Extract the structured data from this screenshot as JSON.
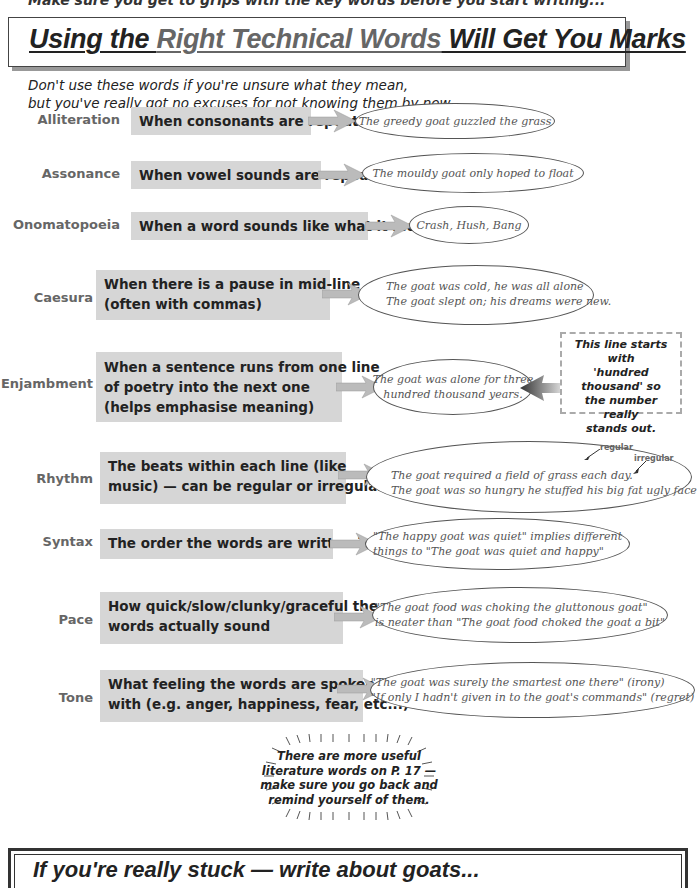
{
  "header": {
    "cut_off_line": "Make sure you get to grips with the key words before you start writing...",
    "title_part1": "Using the ",
    "title_part2": "Right Technical Words",
    "title_part3": " Will Get You Marks"
  },
  "intro": {
    "line1": "Don't use these words if you're unsure what they mean,",
    "line2": "but you've really got no excuses for not knowing them by now..."
  },
  "terms": [
    {
      "term": "Alliteration",
      "definition": [
        "When consonants are repeated"
      ],
      "example": [
        "The greedy goat guzzled the grass"
      ]
    },
    {
      "term": "Assonance",
      "definition": [
        "When vowel sounds are repeated"
      ],
      "example": [
        "The mouldy goat only hoped to float"
      ]
    },
    {
      "term": "Onomatopoeia",
      "definition": [
        "When a word sounds like what it means"
      ],
      "example": [
        "Crash, Hush, Bang"
      ]
    },
    {
      "term": "Caesura",
      "definition": [
        "When there is a pause in mid-line",
        "(often with commas)"
      ],
      "example": [
        "The goat was cold, he was all alone",
        "The goat slept on; his dreams were new."
      ]
    },
    {
      "term": "Enjambment",
      "definition": [
        "When a sentence runs from one line",
        "of poetry into the next one",
        "(helps emphasise meaning)"
      ],
      "example": [
        "The goat was alone for three",
        "hundred thousand years."
      ]
    },
    {
      "term": "Rhythm",
      "definition": [
        "The beats within each line (like",
        "music) — can be regular or irregular"
      ],
      "example": [
        "The goat required a field of grass each day.",
        "The goat was so hungry he stuffed his big fat ugly face"
      ]
    },
    {
      "term": "Syntax",
      "definition": [
        "The order the words are written in"
      ],
      "example": [
        "\"The happy goat was quiet\" implies different",
        "things to \"The goat was quiet and happy\""
      ]
    },
    {
      "term": "Pace",
      "definition": [
        "How quick/slow/clunky/graceful the",
        "words actually sound"
      ],
      "example": [
        "\"The goat food was choking the gluttonous goat\"",
        "is neater than \"The goat food choked the goat a bit\""
      ]
    },
    {
      "term": "Tone",
      "definition": [
        "What feeling the words are spoken",
        "with (e.g. anger, happiness, fear, etc...)"
      ],
      "example": [
        "\"The goat was surely the smartest one there\" (irony)",
        "\"If only I hadn't given in to the goat's commands\" (regret)"
      ]
    }
  ],
  "enjambment_note": [
    "This line starts with",
    "'hundred thousand' so",
    "the number really",
    "stands out."
  ],
  "rhythm_annotations": {
    "regular": "regular",
    "irregular": "irregular"
  },
  "burst_note": [
    "There are more useful",
    "literature words on P. 17 —",
    "make sure you go back and",
    "remind yourself of them."
  ],
  "footer": {
    "text": "If you're really stuck — write about goats..."
  },
  "colors": {
    "definition_box": "#d6d6d6",
    "term_label": "#666666",
    "ellipse_border": "#555555",
    "arrow": "#bbbbbb"
  }
}
